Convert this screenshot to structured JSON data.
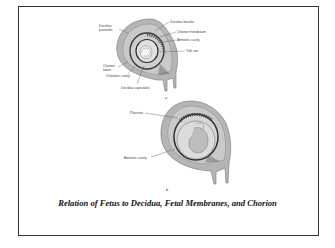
{
  "figure": {
    "caption": "Relation of Fetus to Decidua, Fetal Membranes, and Chorion",
    "panels": [
      {
        "id": "a",
        "sublabel": "a",
        "labels": {
          "decidua_parietalis_1": "Decidua",
          "decidua_parietalis_2": "parietalis",
          "decidua_basalis": "Decidua basalis",
          "chorion_frondosum": "Chorion frondosum",
          "amniotic_cavity": "Amniotic cavity",
          "yolk_sac": "Yolk sac",
          "chorion_laeve_1": "Chorion",
          "chorion_laeve_2": "laeve",
          "chorionic_cavity": "Chorionic cavity",
          "decidua_capsularis": "Decidua capsularis"
        }
      },
      {
        "id": "b",
        "sublabel": "b",
        "labels": {
          "placenta": "Placenta",
          "amniotic_cavity": "Amniotic cavity"
        }
      }
    ],
    "colors": {
      "uterus_wall": "#b5b5b5",
      "decidua": "#c9c9c9",
      "membrane": "#3a3a3a",
      "cavity": "#d8d8d8",
      "frame": "#333333"
    }
  }
}
